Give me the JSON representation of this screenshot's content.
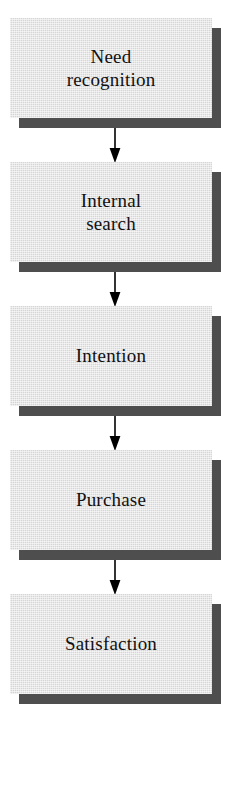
{
  "diagram": {
    "orientation": "vertical",
    "colors": {
      "box_fill": "#d6d6d6",
      "box_shadow": "#4e4e4e",
      "text": "#111111",
      "arrow": "#000000",
      "background": "#ffffff"
    },
    "steps": [
      {
        "id": "need-recognition",
        "label": "Need\nrecognition",
        "x": 10,
        "y": 18,
        "width": 202,
        "height": 100
      },
      {
        "id": "internal-search",
        "label": "Internal\nsearch",
        "x": 10,
        "y": 162,
        "width": 202,
        "height": 100
      },
      {
        "id": "intention",
        "label": "Intention",
        "x": 10,
        "y": 306,
        "width": 202,
        "height": 100
      },
      {
        "id": "purchase",
        "label": "Purchase",
        "x": 10,
        "y": 450,
        "width": 202,
        "height": 100
      },
      {
        "id": "satisfaction",
        "label": "Satisfaction",
        "x": 10,
        "y": 594,
        "width": 202,
        "height": 100
      }
    ],
    "connectors": [
      {
        "id": "arrow-need-to-search",
        "from": "need-recognition",
        "to": "internal-search",
        "x": 108,
        "y": 128,
        "width": 14,
        "height": 36
      },
      {
        "id": "arrow-search-to-intention",
        "from": "internal-search",
        "to": "intention",
        "x": 108,
        "y": 272,
        "width": 14,
        "height": 36
      },
      {
        "id": "arrow-intention-to-purchase",
        "from": "intention",
        "to": "purchase",
        "x": 108,
        "y": 416,
        "width": 14,
        "height": 36
      },
      {
        "id": "arrow-purchase-to-satisfaction",
        "from": "purchase",
        "to": "satisfaction",
        "x": 108,
        "y": 560,
        "width": 14,
        "height": 36
      }
    ]
  }
}
